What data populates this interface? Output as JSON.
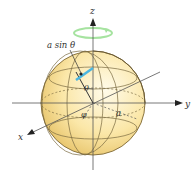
{
  "diagram": {
    "labels": {
      "z_axis": "z",
      "y_axis": "y",
      "x_axis": "x",
      "radius_projection": "a sin θ",
      "polar_angle": "θ",
      "azimuth_angle": "φ",
      "radius": "a"
    },
    "colors": {
      "sphere_light": "#fdf3cf",
      "sphere_dark": "#e8c66a",
      "rotation_arrow": "#8fd98a",
      "highlight_segment": "#4cb6e0",
      "axis": "#555555"
    }
  }
}
